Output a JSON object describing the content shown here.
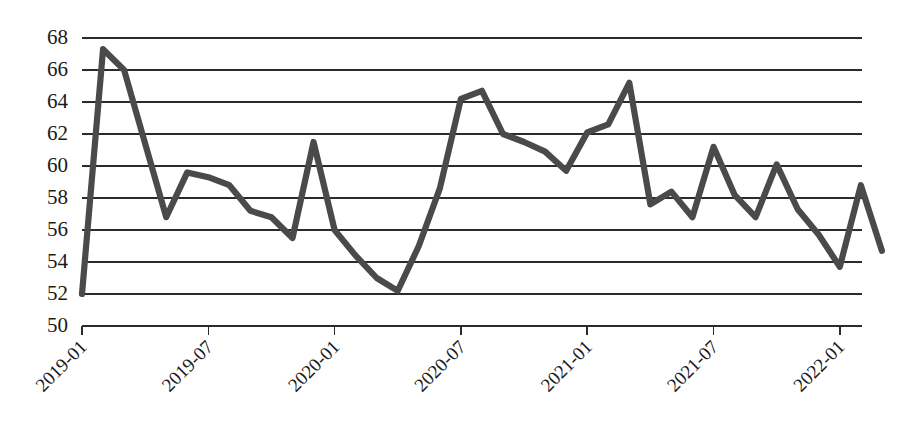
{
  "chart_data": {
    "type": "line",
    "title": "",
    "subtitle": "",
    "xlabel": "",
    "ylabel": "",
    "ylim": [
      50,
      68
    ],
    "ytick_step": 2,
    "yticks": [
      50,
      52,
      54,
      56,
      58,
      60,
      62,
      64,
      66,
      68
    ],
    "xticks": [
      "2019-01",
      "2019-07",
      "2020-01",
      "2020-07",
      "2021-01",
      "2021-07",
      "2022-01"
    ],
    "xtick_rotation": -45,
    "grid": "horizontal",
    "legend": "none",
    "line_color": "#4a4a4a",
    "line_width": 6,
    "markers": "none",
    "x": [
      "2019-01",
      "2019-02",
      "2019-03",
      "2019-04",
      "2019-05",
      "2019-06",
      "2019-07",
      "2019-08",
      "2019-09",
      "2019-10",
      "2019-11",
      "2019-12",
      "2020-01",
      "2020-02",
      "2020-03",
      "2020-04",
      "2020-05",
      "2020-06",
      "2020-07",
      "2020-08",
      "2020-09",
      "2020-10",
      "2020-11",
      "2020-12",
      "2021-01",
      "2021-02",
      "2021-03",
      "2021-04",
      "2021-05",
      "2021-06",
      "2021-07",
      "2021-08",
      "2021-09",
      "2021-10",
      "2021-11",
      "2021-12",
      "2022-01"
    ],
    "series": [
      {
        "name": "series-1",
        "values": [
          52.0,
          67.3,
          66.0,
          61.4,
          56.8,
          59.6,
          59.3,
          58.8,
          57.2,
          56.8,
          55.5,
          61.5,
          56.0,
          54.4,
          53.0,
          52.2,
          55.0,
          58.6,
          64.2,
          64.7,
          62.0,
          61.5,
          60.9,
          59.7,
          62.1,
          62.6,
          65.2,
          57.6,
          58.4,
          56.8,
          61.2,
          58.2,
          56.8,
          60.1,
          57.3,
          55.7,
          53.7
        ]
      }
    ],
    "series_tail": {
      "note": "",
      "extra_x": [
        "2022-02",
        "2022-03"
      ],
      "extra_values": [
        58.8,
        54.7
      ]
    }
  },
  "axis": {
    "y_tick_labels": [
      "68",
      "66",
      "64",
      "62",
      "60",
      "58",
      "56",
      "54",
      "52",
      "50"
    ],
    "x_tick_labels": [
      "2019-01",
      "2019-07",
      "2020-01",
      "2020-07",
      "2021-01",
      "2021-07",
      "2022-01"
    ]
  },
  "colors": {
    "line": "#4a4a4a",
    "grid": "#2b2b2b",
    "axis": "#2b2b2b",
    "text": "#1a1a1a",
    "background": "#ffffff"
  }
}
